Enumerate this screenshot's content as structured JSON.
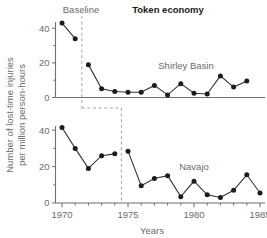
{
  "figure": {
    "title_regular": "Baseline",
    "title_bold": "Token economy",
    "xlabel": "Years",
    "ylabel_line1": "Number of lost-time injuries",
    "ylabel_line2": "per million person-hours"
  },
  "chart_data": {
    "type": "line",
    "title": "Token economy",
    "xlabel": "Years",
    "ylabel": "Number of lost-time injuries per million person-hours",
    "xlim": [
      1968.8,
      1986.0
    ],
    "x_tick_labels": [
      "1970",
      "1975",
      "1980",
      "1985"
    ],
    "x_tick_values": [
      1970,
      1975,
      1980,
      1985
    ],
    "x_minor_ticks": [
      1969,
      1971,
      1972,
      1973,
      1974,
      1976,
      1977,
      1978,
      1979,
      1981,
      1982,
      1983,
      1984,
      1986
    ],
    "grid": false,
    "legend_position": "inline-annotation",
    "phase_labels": [
      "Baseline",
      "Token economy"
    ],
    "panels": [
      {
        "name": "Shirley Basin",
        "label": "Shirley Basin",
        "ylim": [
          0,
          46
        ],
        "y_tick_labels": [
          "0",
          "20",
          "40"
        ],
        "y_tick_values": [
          0,
          20,
          40
        ],
        "y_minor_ticks": [
          10,
          30
        ],
        "phase_change_x": 1971.5,
        "segments": [
          {
            "phase": "Baseline",
            "x": [
              1970,
              1971
            ],
            "y": [
              43,
              34
            ]
          },
          {
            "phase": "Token economy",
            "x": [
              1972,
              1973,
              1974,
              1975,
              1976,
              1977,
              1978,
              1979,
              1980,
              1981,
              1982,
              1983,
              1984
            ],
            "y": [
              19,
              5,
              3.5,
              3,
              3,
              7,
              1.5,
              8,
              2.5,
              2,
              12.5,
              6,
              9.5
            ]
          }
        ]
      },
      {
        "name": "Navajo",
        "label": "Navajo",
        "ylim": [
          0,
          46
        ],
        "y_tick_labels": [
          "0",
          "20",
          "40"
        ],
        "y_tick_values": [
          0,
          20,
          40
        ],
        "y_minor_ticks": [
          10,
          30
        ],
        "phase_change_x": 1974.5,
        "segments": [
          {
            "phase": "Baseline",
            "x": [
              1970,
              1971,
              1972,
              1973,
              1974
            ],
            "y": [
              41.5,
              30,
              19,
              26,
              27
            ]
          },
          {
            "phase": "Token economy",
            "x": [
              1975,
              1976,
              1977,
              1978,
              1979,
              1980,
              1981,
              1982,
              1983,
              1984,
              1985
            ],
            "y": [
              28.5,
              9.5,
              13.5,
              15,
              3.5,
              12,
              4.5,
              3,
              7,
              15.5,
              5.5
            ]
          }
        ]
      }
    ]
  }
}
